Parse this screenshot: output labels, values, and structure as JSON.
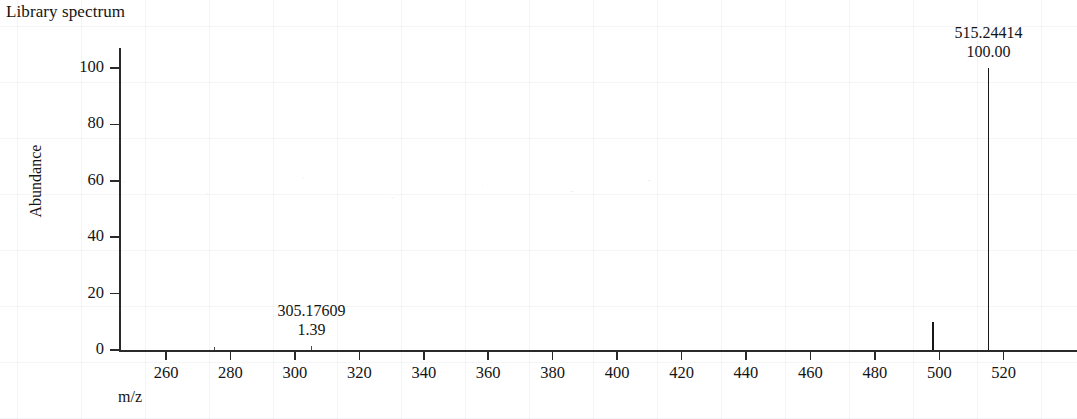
{
  "chart_data": {
    "type": "bar",
    "title": "Library spectrum",
    "xlabel": "m/z",
    "ylabel": "Abundance",
    "xlim": [
      248,
      547
    ],
    "ylim": [
      0,
      107
    ],
    "grid": false,
    "legend": null,
    "x_ticks": [
      260,
      280,
      300,
      320,
      340,
      360,
      380,
      400,
      420,
      440,
      460,
      480,
      500,
      520
    ],
    "y_ticks": [
      0,
      20,
      40,
      60,
      80,
      100
    ],
    "x_tick_labels": [
      "260",
      "280",
      "300",
      "320",
      "340",
      "360",
      "380",
      "400",
      "420",
      "440",
      "460",
      "480",
      "500",
      "520"
    ],
    "y_tick_labels": [
      "0",
      "20",
      "40",
      "60",
      "80",
      "100"
    ],
    "x": [
      275.0,
      305.17609,
      498.0,
      515.24414
    ],
    "values": [
      1.0,
      1.39,
      10.0,
      100.0
    ],
    "peaks": [
      {
        "mz": 275.0,
        "abundance": 1.0,
        "labeled": false,
        "mz_text": "",
        "abundance_text": ""
      },
      {
        "mz": 305.17609,
        "abundance": 1.39,
        "labeled": true,
        "mz_text": "305.17609",
        "abundance_text": "1.39"
      },
      {
        "mz": 498.0,
        "abundance": 10.0,
        "labeled": false,
        "mz_text": "",
        "abundance_text": ""
      },
      {
        "mz": 515.24414,
        "abundance": 100.0,
        "labeled": true,
        "mz_text": "515.24414",
        "abundance_text": "100.00"
      }
    ],
    "annotations": [
      {
        "mz_text": "305.17609",
        "abundance_text": "1.39"
      },
      {
        "mz_text": "515.24414",
        "abundance_text": "100.00"
      }
    ],
    "colors": {
      "axis": "#2a2a2a",
      "peak": "#171717",
      "background": "#ffffff",
      "text": "#141414"
    }
  }
}
